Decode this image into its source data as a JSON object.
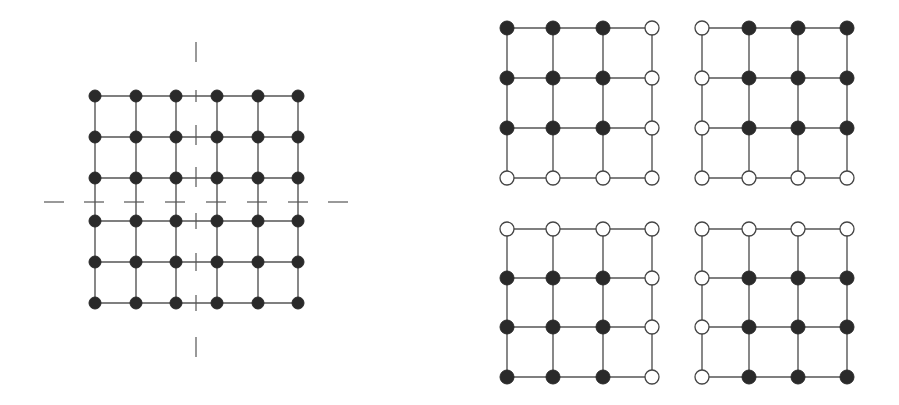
{
  "figure": {
    "colors": {
      "background": "#ffffff",
      "edge": "#555555",
      "filled_node": "#2a2a2a",
      "open_node": "#ffffff",
      "open_node_stroke": "#444444"
    }
  },
  "main_lattice": {
    "rows": 6,
    "cols": 6,
    "x": [
      95,
      136,
      176,
      217,
      258,
      298
    ],
    "y": [
      96,
      137,
      178,
      221,
      262,
      303
    ],
    "node_radius": 6,
    "all_filled": true,
    "vertical_axis": {
      "x": 196,
      "segments": [
        [
          42,
          62
        ],
        [
          90,
          102
        ],
        [
          125,
          145
        ],
        [
          167,
          187
        ],
        [
          213,
          229
        ],
        [
          253,
          271
        ],
        [
          295,
          311
        ],
        [
          337,
          357
        ]
      ]
    },
    "horizontal_axis": {
      "y": 202,
      "segments": [
        [
          44,
          64
        ],
        [
          84,
          104
        ],
        [
          124,
          144
        ],
        [
          165,
          185
        ],
        [
          206,
          226
        ],
        [
          247,
          267
        ],
        [
          288,
          308
        ],
        [
          328,
          348
        ]
      ]
    }
  },
  "sub_lattices": [
    {
      "name": "top-left",
      "x": [
        507,
        553,
        603,
        652
      ],
      "y": [
        28,
        78,
        128,
        178
      ],
      "pattern": [
        [
          1,
          1,
          1,
          0
        ],
        [
          1,
          1,
          1,
          0
        ],
        [
          1,
          1,
          1,
          0
        ],
        [
          0,
          0,
          0,
          0
        ]
      ]
    },
    {
      "name": "top-right",
      "x": [
        702,
        749,
        798,
        847
      ],
      "y": [
        28,
        78,
        128,
        178
      ],
      "pattern": [
        [
          0,
          1,
          1,
          1
        ],
        [
          0,
          1,
          1,
          1
        ],
        [
          0,
          1,
          1,
          1
        ],
        [
          0,
          0,
          0,
          0
        ]
      ]
    },
    {
      "name": "bottom-left",
      "x": [
        507,
        553,
        603,
        652
      ],
      "y": [
        229,
        278,
        327,
        377
      ],
      "pattern": [
        [
          0,
          0,
          0,
          0
        ],
        [
          1,
          1,
          1,
          0
        ],
        [
          1,
          1,
          1,
          0
        ],
        [
          1,
          1,
          1,
          0
        ]
      ]
    },
    {
      "name": "bottom-right",
      "x": [
        702,
        749,
        798,
        847
      ],
      "y": [
        229,
        278,
        327,
        377
      ],
      "pattern": [
        [
          0,
          0,
          0,
          0
        ],
        [
          0,
          1,
          1,
          1
        ],
        [
          0,
          1,
          1,
          1
        ],
        [
          0,
          1,
          1,
          1
        ]
      ]
    }
  ],
  "sub_node_radius": 7
}
